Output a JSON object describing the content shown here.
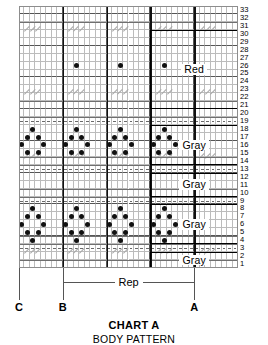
{
  "title": "CHART A",
  "subtitle": "BODY PATTERN",
  "rep_label": "Rep",
  "markers": [
    {
      "id": "C",
      "label": "C",
      "col": 0
    },
    {
      "id": "B",
      "label": "B",
      "col": 8
    },
    {
      "id": "A",
      "label": "A",
      "col": 32
    }
  ],
  "chart_data": {
    "type": "table",
    "title": "CHART A",
    "subtitle": "BODY PATTERN",
    "columns": 40,
    "rows": 33,
    "row_numbering": "bottom-to-top, 1 at bottom, 33 at top",
    "row_labels": [
      "1",
      "2",
      "3",
      "4",
      "5",
      "6",
      "7",
      "8",
      "9",
      "10",
      "11",
      "12",
      "13",
      "14",
      "15",
      "16",
      "17",
      "18",
      "19",
      "20",
      "21",
      "22",
      "23",
      "24",
      "25",
      "26",
      "27",
      "28",
      "29",
      "30",
      "31",
      "32",
      "33"
    ],
    "symbols": {
      "dot": "bobble / purl dot",
      "dash": "dash stitch",
      "slash": "decrease slash"
    },
    "color_boxes": [
      {
        "label": "Red",
        "row_start": 21,
        "row_end": 30
      },
      {
        "label": "Gray",
        "row_start": 14,
        "row_end": 18
      },
      {
        "label": "Gray",
        "row_start": 10,
        "row_end": 12
      },
      {
        "label": "Gray",
        "row_start": 4,
        "row_end": 8
      },
      {
        "label": "Gray",
        "row_start": 1,
        "row_end": 2
      }
    ],
    "dash_rows": [
      3,
      9,
      13,
      19
    ],
    "slash_rows": [
      2,
      14,
      22,
      30
    ],
    "slash_columns": [
      1,
      2,
      3,
      9,
      10,
      11,
      17,
      18,
      19,
      25,
      26,
      27,
      33,
      34,
      35
    ],
    "dot_rows": [
      4,
      5,
      6,
      7,
      8,
      15,
      16,
      17,
      18,
      26
    ],
    "lattice_motif": "diamond lattice repeating every 8 stitches",
    "rep_span_columns": [
      8,
      32
    ]
  }
}
